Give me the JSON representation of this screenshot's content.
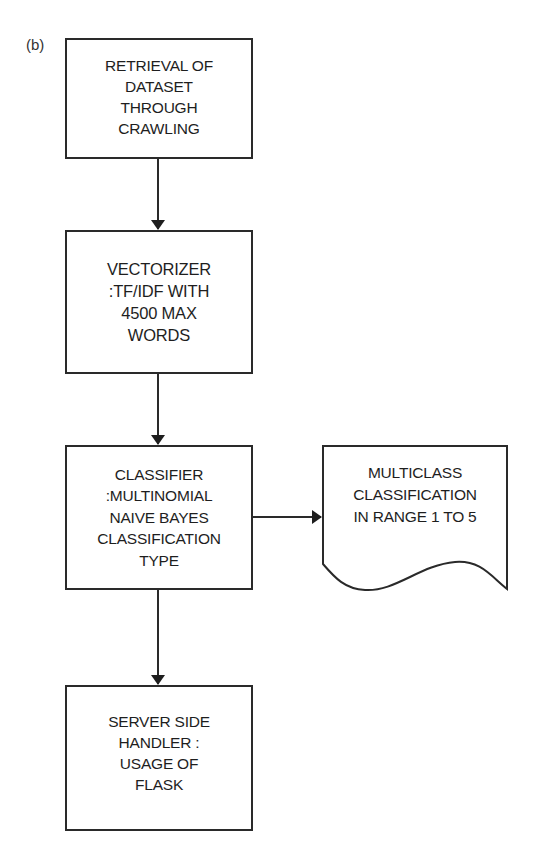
{
  "figure": {
    "panel_label": "(b)"
  },
  "flowchart": {
    "nodes": [
      {
        "id": "retrieval",
        "shape": "process",
        "text": "RETRIEVAL OF\nDATASET\nTHROUGH\nCRAWLING"
      },
      {
        "id": "vectorizer",
        "shape": "process",
        "text": "VECTORIZER\n:TF/IDF WITH\n4500 MAX\nWORDS"
      },
      {
        "id": "classifier",
        "shape": "process",
        "text": "CLASSIFIER\n:MULTINOMIAL\nNAIVE BAYES\nCLASSIFICATION\nTYPE"
      },
      {
        "id": "output",
        "shape": "document",
        "text": "MULTICLASS\nCLASSIFICATION\nIN RANGE 1 TO 5"
      },
      {
        "id": "server",
        "shape": "process",
        "text": "SERVER SIDE\nHANDLER :\nUSAGE OF\nFLASK"
      }
    ],
    "edges": [
      {
        "from": "retrieval",
        "to": "vectorizer"
      },
      {
        "from": "vectorizer",
        "to": "classifier"
      },
      {
        "from": "classifier",
        "to": "output"
      },
      {
        "from": "classifier",
        "to": "server"
      }
    ],
    "colors": {
      "stroke": "#2a2a2a",
      "fill": "#ffffff",
      "text": "#1e1e1e"
    }
  }
}
